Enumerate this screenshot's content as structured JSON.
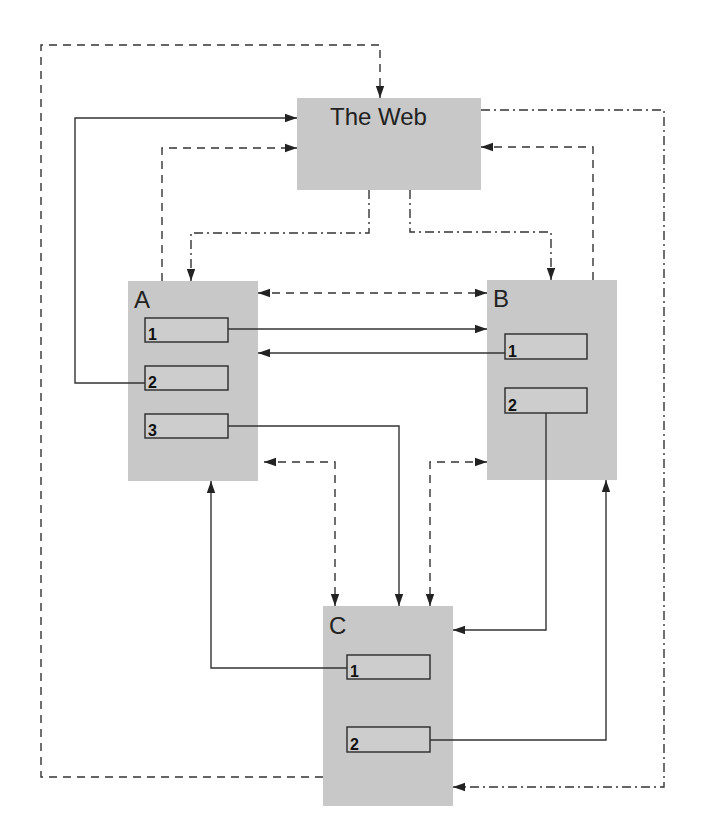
{
  "diagram": {
    "type": "flow-diagram",
    "colors": {
      "node_fill": "#c8c8c8",
      "line": "#333333",
      "background": "#ffffff"
    },
    "nodes": [
      {
        "id": "web",
        "label": "The Web",
        "x": 297,
        "y": 98,
        "w": 184,
        "h": 92,
        "label_x": 330,
        "label_y": 125,
        "slots": []
      },
      {
        "id": "A",
        "label": "A",
        "x": 128,
        "y": 281,
        "w": 130,
        "h": 200,
        "label_x": 134,
        "label_y": 308,
        "slots": [
          {
            "label": "1",
            "x": 145,
            "y": 318,
            "w": 83,
            "h": 24
          },
          {
            "label": "2",
            "x": 145,
            "y": 366,
            "w": 83,
            "h": 24
          },
          {
            "label": "3",
            "x": 145,
            "y": 414,
            "w": 83,
            "h": 24
          }
        ]
      },
      {
        "id": "B",
        "label": "B",
        "x": 487,
        "y": 280,
        "w": 130,
        "h": 200,
        "label_x": 493,
        "label_y": 307,
        "slots": [
          {
            "label": "1",
            "x": 505,
            "y": 334,
            "w": 82,
            "h": 25
          },
          {
            "label": "2",
            "x": 505,
            "y": 388,
            "w": 82,
            "h": 25
          }
        ]
      },
      {
        "id": "C",
        "label": "C",
        "x": 323,
        "y": 606,
        "w": 130,
        "h": 200,
        "label_x": 329,
        "label_y": 634,
        "slots": [
          {
            "label": "1",
            "x": 347,
            "y": 655,
            "w": 83,
            "h": 24
          },
          {
            "label": "2",
            "x": 347,
            "y": 727,
            "w": 83,
            "h": 25
          }
        ]
      }
    ],
    "edges": [
      {
        "name": "c-to-web-outer-dashed",
        "style": "dashed",
        "points": "323,777 41,777 41,45 380,45 380,98",
        "start_arrow": false,
        "end_arrow": true
      },
      {
        "name": "a2-to-web-solid",
        "style": "solid",
        "points": "145,383 75,383 75,118 297,118",
        "start_arrow": false,
        "end_arrow": true
      },
      {
        "name": "a-to-web-dashed",
        "style": "dashed",
        "points": "162,281 162,148 297,148",
        "start_arrow": false,
        "end_arrow": true
      },
      {
        "name": "web-to-a-dashdot",
        "style": "dashdot",
        "points": "369,190 369,233 191,233 191,281",
        "start_arrow": false,
        "end_arrow": true
      },
      {
        "name": "web-to-b-dashdot",
        "style": "dashdot",
        "points": "410,190 410,232 551,232 551,280",
        "start_arrow": false,
        "end_arrow": true
      },
      {
        "name": "b-to-web-dashed",
        "style": "dashed",
        "points": "593,280 593,147 481,147",
        "start_arrow": false,
        "end_arrow": true
      },
      {
        "name": "web-to-c-dashdot-outer",
        "style": "dashdot",
        "points": "481,110 664,110 664,787 453,787",
        "start_arrow": false,
        "end_arrow": true
      },
      {
        "name": "a-b-dashed-bidirectional",
        "style": "dashed",
        "points": "258,293 487,293",
        "start_arrow": true,
        "end_arrow": true
      },
      {
        "name": "a1-to-b-solid",
        "style": "solid",
        "points": "228,329 487,329",
        "start_arrow": false,
        "end_arrow": true
      },
      {
        "name": "b1-to-a-solid",
        "style": "solid",
        "points": "505,353 258,353",
        "start_arrow": false,
        "end_arrow": true
      },
      {
        "name": "a3-to-c-solid",
        "style": "solid",
        "points": "228,426 399,426 399,606",
        "start_arrow": false,
        "end_arrow": true
      },
      {
        "name": "a-c-dashed-bidirectional",
        "style": "dashed",
        "points": "264,462 335,462 335,606",
        "start_arrow": true,
        "end_arrow": true
      },
      {
        "name": "b-c-dashed-bidirectional",
        "style": "dashed",
        "points": "487,462 430,462 430,606",
        "start_arrow": true,
        "end_arrow": true
      },
      {
        "name": "b2-to-c-solid",
        "style": "solid",
        "points": "546,413 546,630 453,630",
        "start_arrow": false,
        "end_arrow": true
      },
      {
        "name": "c1-to-a-solid",
        "style": "solid",
        "points": "347,668 211,668 211,481",
        "start_arrow": false,
        "end_arrow": true
      },
      {
        "name": "c2-to-b-solid",
        "style": "solid",
        "points": "430,740 606,740 606,480",
        "start_arrow": false,
        "end_arrow": true
      }
    ]
  }
}
